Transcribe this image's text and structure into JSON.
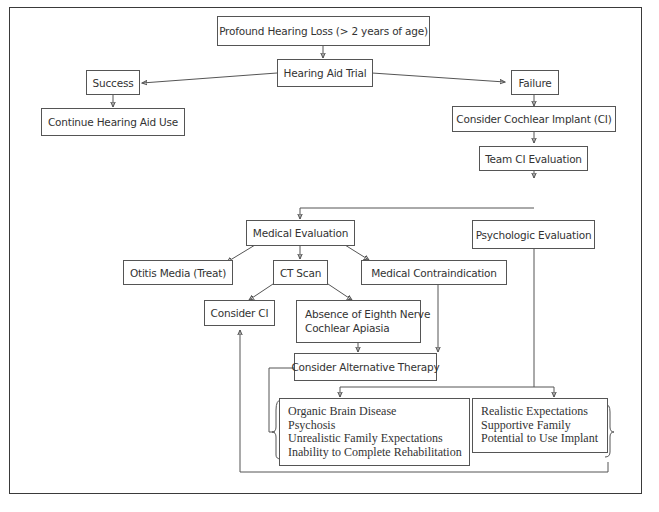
{
  "diagram": {
    "type": "flowchart",
    "title": "",
    "nodes": {
      "profound_loss": "Profound Hearing Loss (> 2 years of age)",
      "hearing_aid_trial": "Hearing Aid Trial",
      "success": "Success",
      "failure": "Failure",
      "continue_use": "Continue Hearing Aid Use",
      "consider_ci": "Consider Cochlear Implant (CI)",
      "team_eval": "Team CI Evaluation",
      "medical_eval": "Medical Evaluation",
      "psych_eval": "Psychologic Evaluation",
      "otitis": "Otitis Media (Treat)",
      "ct_scan": "CT Scan",
      "contraindication": "Medical Contraindication",
      "consider_ci_short": "Consider CI",
      "absence": [
        "Absence of Eighth Nerve",
        "Cochlear Apiasia"
      ],
      "alt_therapy": "Consider Alternative Therapy",
      "negative_factors": [
        "Organic Brain Disease",
        "Psychosis",
        "Unrealistic Family Expectations",
        "Inability to Complete Rehabilitation"
      ],
      "positive_factors": [
        "Realistic Expectations",
        "Supportive Family",
        "Potential to Use Implant"
      ]
    },
    "edges": [
      [
        "profound_loss",
        "hearing_aid_trial"
      ],
      [
        "hearing_aid_trial",
        "success"
      ],
      [
        "hearing_aid_trial",
        "failure"
      ],
      [
        "success",
        "continue_use"
      ],
      [
        "failure",
        "consider_ci"
      ],
      [
        "consider_ci",
        "team_eval"
      ],
      [
        "team_eval",
        "medical_eval"
      ],
      [
        "team_eval",
        "psych_eval"
      ],
      [
        "medical_eval",
        "otitis"
      ],
      [
        "medical_eval",
        "ct_scan"
      ],
      [
        "medical_eval",
        "contraindication"
      ],
      [
        "ct_scan",
        "consider_ci_short"
      ],
      [
        "ct_scan",
        "absence"
      ],
      [
        "absence",
        "alt_therapy"
      ],
      [
        "contraindication",
        "alt_therapy"
      ],
      [
        "psych_eval",
        "negative_factors"
      ],
      [
        "psych_eval",
        "positive_factors"
      ],
      [
        "negative_factors",
        "alt_therapy"
      ],
      [
        "positive_factors",
        "consider_ci_short"
      ]
    ]
  }
}
